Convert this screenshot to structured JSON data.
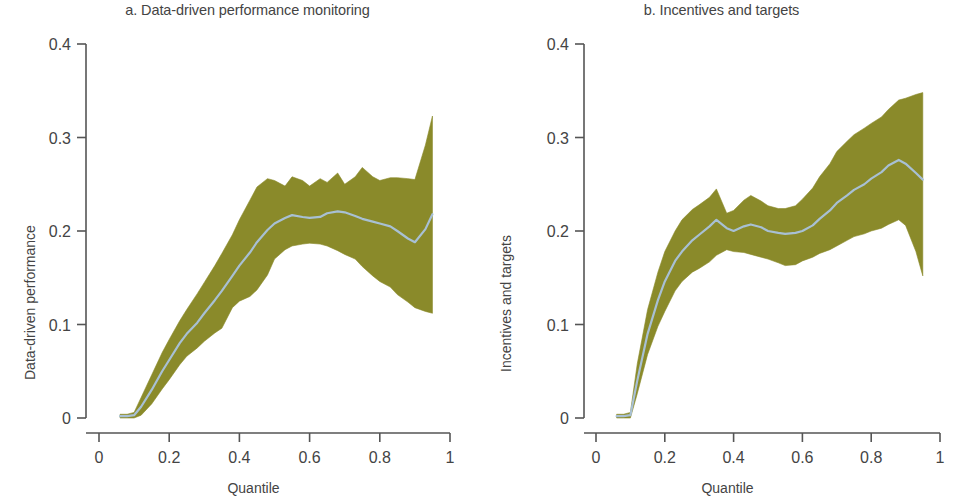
{
  "figure": {
    "background": "#ffffff",
    "band_color": "#8a8a2a",
    "line_color": "#a8c0d4",
    "axis_color": "#555555",
    "text_color": "#444444"
  },
  "panels": [
    {
      "id": "a",
      "title": "a. Data-driven performance monitoring",
      "xlabel": "Quantile",
      "ylabel": "Data-driven performance"
    },
    {
      "id": "b",
      "title": "b. Incentives and targets",
      "xlabel": "Quantile",
      "ylabel": "Incentives and targets"
    }
  ],
  "chart_data": [
    {
      "type": "line",
      "panel": "a",
      "title": "a. Data-driven performance monitoring",
      "xlabel": "Quantile",
      "ylabel": "Data-driven performance",
      "xlim": [
        0,
        1
      ],
      "ylim": [
        0,
        0.4
      ],
      "xticks": [
        0,
        0.2,
        0.4,
        0.6,
        0.8,
        1
      ],
      "xtick_labels": [
        "0",
        "0.2",
        "0.4",
        "0.6",
        "0.8",
        "1"
      ],
      "yticks": [
        0,
        0.1,
        0.2,
        0.3,
        0.4
      ],
      "ytick_labels": [
        "0",
        "0.1",
        "0.2",
        "0.3",
        "0.4"
      ],
      "grid": false,
      "legend": "none",
      "x": [
        0.06,
        0.08,
        0.1,
        0.12,
        0.15,
        0.18,
        0.2,
        0.23,
        0.25,
        0.28,
        0.3,
        0.33,
        0.35,
        0.38,
        0.4,
        0.43,
        0.45,
        0.48,
        0.5,
        0.53,
        0.55,
        0.58,
        0.6,
        0.63,
        0.65,
        0.68,
        0.7,
        0.73,
        0.75,
        0.78,
        0.8,
        0.83,
        0.85,
        0.88,
        0.9,
        0.93,
        0.95
      ],
      "series": [
        {
          "name": "Coefficient estimate",
          "values": [
            0.002,
            0.002,
            0.003,
            0.012,
            0.03,
            0.05,
            0.062,
            0.08,
            0.09,
            0.102,
            0.112,
            0.126,
            0.136,
            0.152,
            0.163,
            0.177,
            0.188,
            0.201,
            0.208,
            0.214,
            0.217,
            0.215,
            0.214,
            0.215,
            0.219,
            0.221,
            0.22,
            0.216,
            0.213,
            0.21,
            0.208,
            0.205,
            0.2,
            0.192,
            0.188,
            0.202,
            0.218
          ]
        },
        {
          "name": "Confidence band upper",
          "values": [
            0.004,
            0.004,
            0.006,
            0.022,
            0.046,
            0.07,
            0.084,
            0.104,
            0.116,
            0.133,
            0.145,
            0.163,
            0.176,
            0.196,
            0.212,
            0.233,
            0.247,
            0.256,
            0.254,
            0.248,
            0.258,
            0.254,
            0.248,
            0.256,
            0.252,
            0.262,
            0.25,
            0.258,
            0.268,
            0.258,
            0.254,
            0.257,
            0.257,
            0.256,
            0.255,
            0.292,
            0.323
          ]
        },
        {
          "name": "Confidence band lower",
          "values": [
            0.0,
            0.0,
            0.0,
            0.003,
            0.015,
            0.031,
            0.041,
            0.057,
            0.066,
            0.075,
            0.082,
            0.091,
            0.096,
            0.118,
            0.125,
            0.13,
            0.137,
            0.153,
            0.17,
            0.18,
            0.184,
            0.186,
            0.187,
            0.186,
            0.184,
            0.179,
            0.175,
            0.17,
            0.162,
            0.152,
            0.146,
            0.14,
            0.132,
            0.124,
            0.118,
            0.114,
            0.112
          ]
        }
      ]
    },
    {
      "type": "line",
      "panel": "b",
      "title": "b. Incentives and targets",
      "xlabel": "Quantile",
      "ylabel": "Incentives and targets",
      "xlim": [
        0,
        1
      ],
      "ylim": [
        0,
        0.4
      ],
      "xticks": [
        0,
        0.2,
        0.4,
        0.6,
        0.8,
        1
      ],
      "xtick_labels": [
        "0",
        "0.2",
        "0.4",
        "0.6",
        "0.8",
        "1"
      ],
      "yticks": [
        0,
        0.1,
        0.2,
        0.3,
        0.4
      ],
      "ytick_labels": [
        "0",
        "0.1",
        "0.2",
        "0.3",
        "0.4"
      ],
      "grid": false,
      "legend": "none",
      "x": [
        0.06,
        0.08,
        0.1,
        0.12,
        0.15,
        0.18,
        0.2,
        0.23,
        0.25,
        0.28,
        0.3,
        0.33,
        0.35,
        0.38,
        0.4,
        0.43,
        0.45,
        0.48,
        0.5,
        0.53,
        0.55,
        0.58,
        0.6,
        0.63,
        0.65,
        0.68,
        0.7,
        0.73,
        0.75,
        0.78,
        0.8,
        0.83,
        0.85,
        0.88,
        0.9,
        0.93,
        0.95
      ],
      "series": [
        {
          "name": "Coefficient estimate",
          "values": [
            0.002,
            0.002,
            0.003,
            0.04,
            0.09,
            0.126,
            0.146,
            0.168,
            0.178,
            0.19,
            0.196,
            0.205,
            0.212,
            0.203,
            0.2,
            0.205,
            0.207,
            0.204,
            0.2,
            0.198,
            0.197,
            0.198,
            0.2,
            0.206,
            0.213,
            0.222,
            0.23,
            0.238,
            0.244,
            0.25,
            0.256,
            0.263,
            0.27,
            0.276,
            0.272,
            0.262,
            0.255
          ]
        },
        {
          "name": "Confidence band upper",
          "values": [
            0.004,
            0.004,
            0.006,
            0.058,
            0.116,
            0.156,
            0.178,
            0.2,
            0.212,
            0.223,
            0.228,
            0.236,
            0.245,
            0.219,
            0.222,
            0.233,
            0.238,
            0.232,
            0.227,
            0.224,
            0.224,
            0.227,
            0.234,
            0.246,
            0.258,
            0.272,
            0.285,
            0.296,
            0.303,
            0.31,
            0.315,
            0.322,
            0.33,
            0.34,
            0.342,
            0.346,
            0.348
          ]
        },
        {
          "name": "Confidence band lower",
          "values": [
            0.0,
            0.0,
            0.0,
            0.026,
            0.068,
            0.098,
            0.114,
            0.136,
            0.146,
            0.156,
            0.16,
            0.167,
            0.174,
            0.18,
            0.178,
            0.177,
            0.175,
            0.172,
            0.17,
            0.166,
            0.163,
            0.164,
            0.168,
            0.172,
            0.176,
            0.18,
            0.184,
            0.19,
            0.194,
            0.197,
            0.2,
            0.203,
            0.207,
            0.212,
            0.206,
            0.178,
            0.152
          ]
        }
      ]
    }
  ]
}
